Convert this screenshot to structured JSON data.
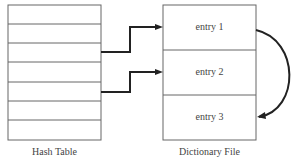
{
  "hash_table": {
    "label": "Hash Table",
    "rows": 7
  },
  "dictionary_file": {
    "label": "Dictionary File",
    "entries": [
      "entry 1",
      "entry 2",
      "entry 3"
    ]
  },
  "arrows": [
    {
      "from": "hash-table-row-3",
      "to": "entry 1"
    },
    {
      "from": "hash-table-row-5",
      "to": "entry 2"
    },
    {
      "from": "entry 1",
      "to": "entry 3",
      "style": "curved"
    }
  ]
}
